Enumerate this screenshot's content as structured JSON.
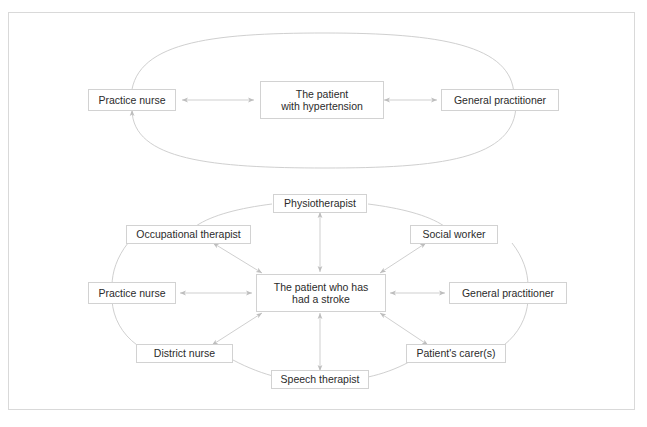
{
  "figure": {
    "background_color": "#ffffff",
    "frame_color": "#d9d9d9",
    "box_border_color": "#d2d2d2",
    "connector_color": "#bdbdbd",
    "text_color": "#2b2b2b"
  },
  "diagrams": [
    {
      "id": "hypertension",
      "center": {
        "label": "The patient\nwith hypertension",
        "line1": "The patient",
        "line2": "with hypertension"
      },
      "nodes": [
        {
          "label": "Practice nurse"
        },
        {
          "label": "General practitioner"
        }
      ],
      "ring": "ellipse",
      "arrows": [
        {
          "from": "Practice nurse",
          "to": "The patient with hypertension",
          "style": "double"
        },
        {
          "from": "The patient with hypertension",
          "to": "General practitioner",
          "style": "double"
        },
        {
          "from": "Practice nurse",
          "to": "General practitioner",
          "style": "ellipse-double"
        }
      ]
    },
    {
      "id": "stroke",
      "center": {
        "label": "The patient who has\nhad a stroke",
        "line1": "The patient who has",
        "line2": "had a stroke"
      },
      "nodes": [
        {
          "label": "Physiotherapist"
        },
        {
          "label": "Social worker"
        },
        {
          "label": "General practitioner"
        },
        {
          "label": "Patient's carer(s)"
        },
        {
          "label": "Speech therapist"
        },
        {
          "label": "District nurse"
        },
        {
          "label": "Practice nurse"
        },
        {
          "label": "Occupational therapist"
        }
      ],
      "ring": "ellipse",
      "arrows": [
        {
          "from": "Physiotherapist",
          "to": "The patient who has had a stroke",
          "style": "double"
        },
        {
          "from": "Social worker",
          "to": "The patient who has had a stroke",
          "style": "double"
        },
        {
          "from": "General practitioner",
          "to": "The patient who has had a stroke",
          "style": "double"
        },
        {
          "from": "Patient's carer(s)",
          "to": "The patient who has had a stroke",
          "style": "double"
        },
        {
          "from": "Speech therapist",
          "to": "The patient who has had a stroke",
          "style": "double"
        },
        {
          "from": "District nurse",
          "to": "The patient who has had a stroke",
          "style": "double"
        },
        {
          "from": "Practice nurse",
          "to": "The patient who has had a stroke",
          "style": "double"
        },
        {
          "from": "Occupational therapist",
          "to": "The patient who has had a stroke",
          "style": "double"
        }
      ]
    }
  ],
  "labels": {
    "top_practice_nurse": "Practice nurse",
    "top_center_line1": "The patient",
    "top_center_line2": "with hypertension",
    "top_general_practitioner": "General practitioner",
    "physiotherapist": "Physiotherapist",
    "occupational_therapist": "Occupational therapist",
    "social_worker": "Social worker",
    "bottom_practice_nurse": "Practice nurse",
    "bottom_center_line1": "The patient who has",
    "bottom_center_line2": "had a stroke",
    "bottom_general_practitioner": "General practitioner",
    "district_nurse": "District nurse",
    "patients_carers": "Patient's carer(s)",
    "speech_therapist": "Speech therapist"
  }
}
